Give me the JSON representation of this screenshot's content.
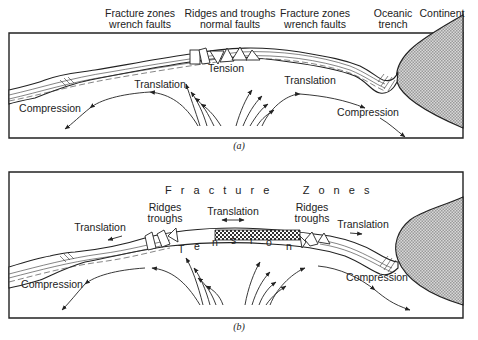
{
  "panel_a": {
    "caption": "(a)",
    "top_labels": [
      {
        "line1": "Fracture zones",
        "line2": "wrench faults"
      },
      {
        "line1": "Ridges and troughs",
        "line2": "normal faults"
      },
      {
        "line1": "Fracture zones",
        "line2": "wrench faults"
      },
      {
        "line1": "Oceanic",
        "line2": "trench"
      },
      {
        "line1": "Continent",
        "line2": ""
      }
    ],
    "inner_labels": {
      "tension": "Tension",
      "translation_left": "Translation",
      "translation_right": "Translation",
      "compression_left": "Compression",
      "compression_right": "Compression"
    }
  },
  "panel_b": {
    "caption": "(b)",
    "fracture_zones": "F r a c t u r e     Z o n e s",
    "inner_labels": {
      "ridges_left_1": "Ridges",
      "ridges_left_2": "troughs",
      "ridges_right_1": "Ridges",
      "ridges_right_2": "troughs",
      "translation_left": "Translation",
      "translation_center": "Translation",
      "translation_right": "Translation",
      "tension_letters": [
        "T",
        "e",
        "n",
        "s",
        "i",
        "o",
        "n"
      ],
      "compression_left": "Compression",
      "compression_right": "Compression"
    }
  },
  "colors": {
    "ink": "#222222",
    "background": "#ffffff",
    "continent_fill": "#c8c8c8"
  }
}
